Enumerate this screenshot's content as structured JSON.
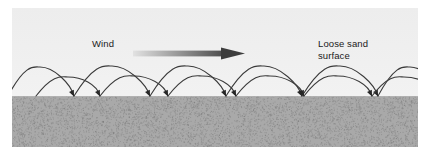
{
  "figure": {
    "width": 428,
    "height": 167,
    "background": "#ffffff"
  },
  "panel": {
    "sky_color_top": "#ededed",
    "sky_color_bottom": "#f2f2f2",
    "sand_color": "#a9a9a9",
    "sand_speckle_color": "#6e6e6e",
    "surface_y": 96
  },
  "labels": {
    "wind": "Wind",
    "loose_sand_line1": "Loose sand",
    "loose_sand_line2": "surface",
    "text_color": "#1a1a1a"
  },
  "wind_arrow": {
    "name": "wind-direction-arrow",
    "direction": "right",
    "gradient_from": "#e2e2e2",
    "gradient_to": "#4a4a4a",
    "head_color": "#3d3d3d"
  },
  "trajectories": {
    "stroke_color": "#3a3a3a",
    "stroke_width": 1.1,
    "arrowhead_color": "#262626",
    "description": "Ballistic saltation paths of sand grains: long shallow ascent downwind, steep descent impacting the loose sand surface",
    "series": [
      {
        "name": "upper-trajectory-arcs",
        "apex_y": 66,
        "arcs": [
          {
            "start_x": -4,
            "apex_x": 28,
            "end_x": 62,
            "apex_y": 67
          },
          {
            "start_x": 62,
            "apex_x": 100,
            "end_x": 138,
            "apex_y": 66
          },
          {
            "start_x": 138,
            "apex_x": 176,
            "end_x": 214,
            "apex_y": 66
          },
          {
            "start_x": 214,
            "apex_x": 252,
            "end_x": 290,
            "apex_y": 66
          },
          {
            "start_x": 290,
            "apex_x": 328,
            "end_x": 366,
            "apex_y": 66
          },
          {
            "start_x": 366,
            "apex_x": 398,
            "end_x": 430,
            "apex_y": 67
          }
        ]
      },
      {
        "name": "lower-trajectory-arcs",
        "apex_y": 76,
        "arcs": [
          {
            "start_x": 24,
            "apex_x": 56,
            "end_x": 88,
            "apex_y": 77
          },
          {
            "start_x": 88,
            "apex_x": 122,
            "end_x": 156,
            "apex_y": 76
          },
          {
            "start_x": 156,
            "apex_x": 190,
            "end_x": 224,
            "apex_y": 76
          },
          {
            "start_x": 224,
            "apex_x": 258,
            "end_x": 292,
            "apex_y": 76
          },
          {
            "start_x": 292,
            "apex_x": 326,
            "end_x": 360,
            "apex_y": 76
          },
          {
            "start_x": 360,
            "apex_x": 392,
            "end_x": 426,
            "apex_y": 77
          }
        ]
      }
    ]
  }
}
